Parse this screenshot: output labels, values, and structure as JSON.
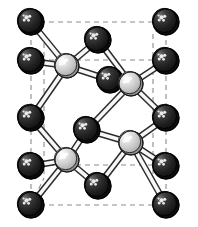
{
  "figure": {
    "background_color": "#ffffff"
  },
  "legend": {
    "species": [
      {
        "name": "anion-atom",
        "label": "dark atom",
        "color": "#262626",
        "highlight_color": "#f2f2f2",
        "outline_color": "#000000",
        "radius": 13
      },
      {
        "name": "cation-atom",
        "label": "light atom",
        "color": "#c9c9c9",
        "highlight_color": "#ffffff",
        "outline_color": "#1a1a1a",
        "radius": 12
      }
    ]
  },
  "cell": {
    "edge_color": "#8c8c8c",
    "edge_style": "dashed",
    "edges": [
      {
        "name": "cell-edge-top-front",
        "x1": 31,
        "y1": 22,
        "x2": 166,
        "y2": 22
      },
      {
        "name": "cell-edge-top-back",
        "x1": 31,
        "y1": 60,
        "x2": 166,
        "y2": 60
      },
      {
        "name": "cell-edge-bottom-back",
        "x1": 31,
        "y1": 165,
        "x2": 166,
        "y2": 165
      },
      {
        "name": "cell-edge-bottom-front",
        "x1": 31,
        "y1": 205,
        "x2": 166,
        "y2": 205
      },
      {
        "name": "cell-edge-left-front",
        "x1": 31,
        "y1": 22,
        "x2": 31,
        "y2": 205
      },
      {
        "name": "cell-edge-right-front",
        "x1": 166,
        "y1": 22,
        "x2": 166,
        "y2": 205
      },
      {
        "name": "cell-edge-left-back",
        "x1": 44,
        "y1": 34,
        "x2": 44,
        "y2": 178
      },
      {
        "name": "cell-edge-right-back",
        "x1": 153,
        "y1": 34,
        "x2": 153,
        "y2": 178
      },
      {
        "name": "cell-edge-depth-tl",
        "x1": 31,
        "y1": 22,
        "x2": 44,
        "y2": 34
      },
      {
        "name": "cell-edge-depth-tr",
        "x1": 166,
        "y1": 22,
        "x2": 153,
        "y2": 34
      },
      {
        "name": "cell-edge-depth-bl",
        "x1": 31,
        "y1": 205,
        "x2": 44,
        "y2": 178
      },
      {
        "name": "cell-edge-depth-br",
        "x1": 166,
        "y1": 205,
        "x2": 153,
        "y2": 178
      }
    ]
  },
  "bonds": {
    "color_fill": "#f7f7f7",
    "color_stroke": "#2b2b2b",
    "width": 5,
    "list": [
      {
        "name": "bond",
        "from": "a-tl-front",
        "to": "c-upper-left"
      },
      {
        "name": "bond",
        "from": "a-tl-back",
        "to": "c-upper-left"
      },
      {
        "name": "bond",
        "from": "a-top-mid",
        "to": "c-upper-left"
      },
      {
        "name": "bond",
        "from": "a-mid-left",
        "to": "c-upper-left"
      },
      {
        "name": "bond",
        "from": "a-ul-inner",
        "to": "c-upper-left"
      },
      {
        "name": "bond",
        "from": "a-top-mid",
        "to": "c-upper-right"
      },
      {
        "name": "bond",
        "from": "a-tr-back",
        "to": "c-upper-right"
      },
      {
        "name": "bond",
        "from": "a-ul-inner",
        "to": "c-upper-right"
      },
      {
        "name": "bond",
        "from": "a-mid-right",
        "to": "c-upper-right"
      },
      {
        "name": "bond",
        "from": "a-center",
        "to": "c-upper-right"
      },
      {
        "name": "bond",
        "from": "a-mid-left",
        "to": "c-lower-left"
      },
      {
        "name": "bond",
        "from": "a-center",
        "to": "c-lower-left"
      },
      {
        "name": "bond",
        "from": "a-bl-back",
        "to": "c-lower-left"
      },
      {
        "name": "bond",
        "from": "a-bl-front",
        "to": "c-lower-left"
      },
      {
        "name": "bond",
        "from": "a-bot-mid",
        "to": "c-lower-left"
      },
      {
        "name": "bond",
        "from": "a-center",
        "to": "c-lower-right"
      },
      {
        "name": "bond",
        "from": "a-mid-right",
        "to": "c-lower-right"
      },
      {
        "name": "bond",
        "from": "a-br-back",
        "to": "c-lower-right"
      },
      {
        "name": "bond",
        "from": "a-bot-mid",
        "to": "c-lower-right"
      },
      {
        "name": "bond",
        "from": "a-br-front",
        "to": "c-lower-right"
      }
    ]
  },
  "atoms": [
    {
      "id": "a-tl-front",
      "name": "atom-dark-top-left-front",
      "species": "anion-atom",
      "cx": 31,
      "cy": 22,
      "r": 13
    },
    {
      "id": "a-tr-front",
      "name": "atom-dark-top-right-front",
      "species": "anion-atom",
      "cx": 166,
      "cy": 22,
      "r": 13
    },
    {
      "id": "a-top-mid",
      "name": "atom-dark-top-middle",
      "species": "anion-atom",
      "cx": 98,
      "cy": 40,
      "r": 13
    },
    {
      "id": "a-tl-back",
      "name": "atom-dark-upper-left-back",
      "species": "anion-atom",
      "cx": 31,
      "cy": 61,
      "r": 13
    },
    {
      "id": "a-tr-back",
      "name": "atom-dark-upper-right-back",
      "species": "anion-atom",
      "cx": 166,
      "cy": 61,
      "r": 13
    },
    {
      "id": "a-ul-inner",
      "name": "atom-dark-inner-upper",
      "species": "anion-atom",
      "cx": 110,
      "cy": 80,
      "r": 13
    },
    {
      "id": "a-mid-left",
      "name": "atom-dark-mid-left",
      "species": "anion-atom",
      "cx": 31,
      "cy": 118,
      "r": 13
    },
    {
      "id": "a-mid-right",
      "name": "atom-dark-mid-right",
      "species": "anion-atom",
      "cx": 166,
      "cy": 118,
      "r": 13
    },
    {
      "id": "a-center",
      "name": "atom-dark-inner-lower",
      "species": "anion-atom",
      "cx": 87,
      "cy": 130,
      "r": 13
    },
    {
      "id": "a-bl-back",
      "name": "atom-dark-lower-left-back",
      "species": "anion-atom",
      "cx": 31,
      "cy": 166,
      "r": 13
    },
    {
      "id": "a-br-back",
      "name": "atom-dark-lower-right-back",
      "species": "anion-atom",
      "cx": 166,
      "cy": 166,
      "r": 13
    },
    {
      "id": "a-bot-mid",
      "name": "atom-dark-bottom-middle",
      "species": "anion-atom",
      "cx": 98,
      "cy": 186,
      "r": 13
    },
    {
      "id": "a-bl-front",
      "name": "atom-dark-bottom-left-front",
      "species": "anion-atom",
      "cx": 31,
      "cy": 205,
      "r": 13
    },
    {
      "id": "a-br-front",
      "name": "atom-dark-bottom-right-front",
      "species": "anion-atom",
      "cx": 166,
      "cy": 205,
      "r": 13
    },
    {
      "id": "c-upper-left",
      "name": "atom-light-upper-left",
      "species": "cation-atom",
      "cx": 67,
      "cy": 66,
      "r": 12
    },
    {
      "id": "c-upper-right",
      "name": "atom-light-upper-right",
      "species": "cation-atom",
      "cx": 131,
      "cy": 84,
      "r": 12
    },
    {
      "id": "c-lower-right",
      "name": "atom-light-lower-right",
      "species": "cation-atom",
      "cx": 131,
      "cy": 143,
      "r": 12
    },
    {
      "id": "c-lower-left",
      "name": "atom-light-lower-left",
      "species": "cation-atom",
      "cx": 67,
      "cy": 160,
      "r": 12
    }
  ]
}
